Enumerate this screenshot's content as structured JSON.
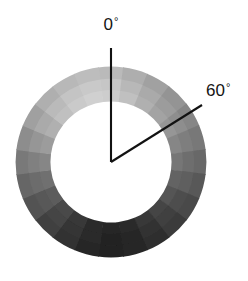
{
  "figure": {
    "background_color": "#ffffff",
    "line_color": "#121212",
    "text_color": "#141414",
    "width": 248,
    "height": 281
  },
  "annulus": {
    "center_x": 111,
    "center_y": 162,
    "outer_radius": 95,
    "inner_radius": 61,
    "radial_band_count": 3,
    "angular_segment_count": 24,
    "segment_degrees": 15,
    "zero_reference": "up (12 o'clock), angles increase clockwise"
  },
  "annotations": [
    {
      "name": "zero-degree-axis",
      "label": "0",
      "degree_symbol": "°",
      "label_text": "0°",
      "angle_deg": 0,
      "line_from": [
        111,
        162
      ],
      "line_to": [
        111,
        48
      ],
      "label_x": 111,
      "label_y": 30
    },
    {
      "name": "sixty-degree-leader",
      "label": "60",
      "degree_symbol": "°",
      "label_text": "60°",
      "angle_deg": 60,
      "line_from": [
        111,
        162
      ],
      "line_to": [
        202,
        105
      ],
      "label_x": 206,
      "label_y": 96
    }
  ],
  "chart_data": {
    "type": "heatmap",
    "xlabel": "",
    "ylabel": "",
    "colormap": "grayscale",
    "value_range": [
      0,
      255
    ],
    "angles_deg": [
      0,
      15,
      30,
      45,
      60,
      75,
      90,
      105,
      120,
      135,
      150,
      165,
      180,
      195,
      210,
      225,
      240,
      255,
      270,
      285,
      300,
      315,
      330,
      345
    ],
    "radial_bands": [
      "inner",
      "middle",
      "outer"
    ],
    "series": [
      {
        "name": "inner",
        "values": [
          205,
          192,
          176,
          163,
          150,
          134,
          118,
          100,
          84,
          68,
          55,
          44,
          38,
          44,
          56,
          72,
          92,
          112,
          134,
          156,
          176,
          192,
          202,
          208
        ]
      },
      {
        "name": "middle",
        "values": [
          198,
          184,
          170,
          156,
          142,
          126,
          110,
          94,
          78,
          63,
          50,
          40,
          34,
          41,
          52,
          68,
          88,
          108,
          128,
          150,
          170,
          186,
          196,
          201
        ]
      },
      {
        "name": "outer",
        "values": [
          186,
          174,
          161,
          148,
          134,
          120,
          104,
          88,
          73,
          59,
          47,
          37,
          32,
          38,
          49,
          64,
          83,
          102,
          121,
          141,
          160,
          175,
          184,
          189
        ]
      }
    ],
    "legend_position": "none",
    "grid": false
  }
}
